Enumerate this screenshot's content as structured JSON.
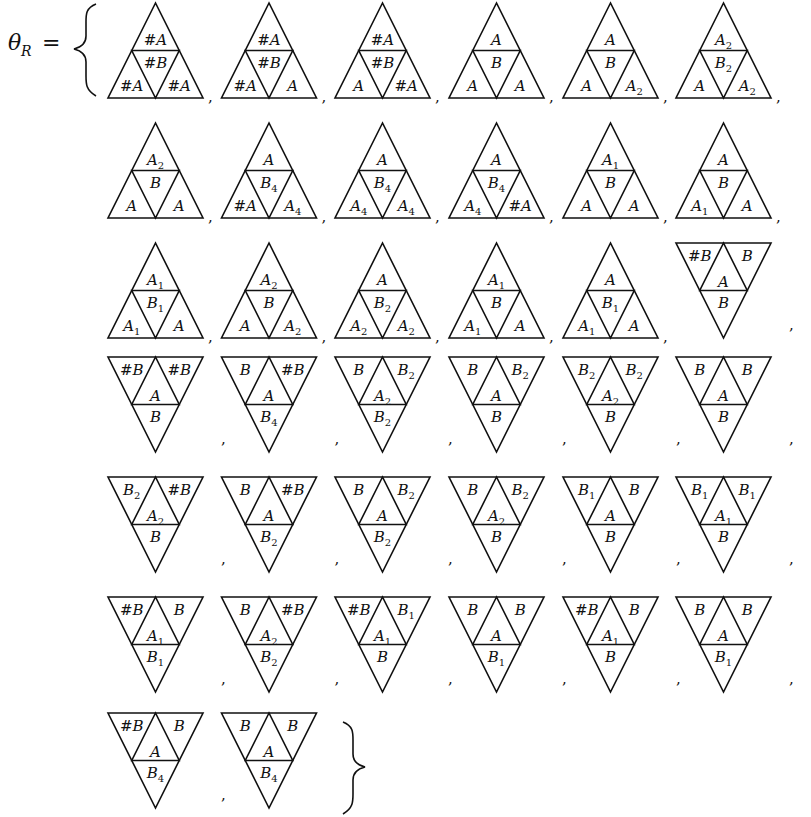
{
  "equation": {
    "lhs_symbol": "θ",
    "lhs_subscript": "R",
    "equals": "=",
    "separator": ",",
    "open_brace": "{",
    "close_brace": "}"
  },
  "legend_note": "Each element is a 4-cell triangle: up-triangles list [top, center, bottom-left, bottom-right]; down-triangles list [top-left, top-right, center, bottom].",
  "elements": [
    {
      "orientation": "up",
      "cells": [
        {
          "base": "#A"
        },
        {
          "base": "#B"
        },
        {
          "base": "#A"
        },
        {
          "base": "#A"
        }
      ]
    },
    {
      "orientation": "up",
      "cells": [
        {
          "base": "#A"
        },
        {
          "base": "#B"
        },
        {
          "base": "#A"
        },
        {
          "base": "A"
        }
      ]
    },
    {
      "orientation": "up",
      "cells": [
        {
          "base": "#A"
        },
        {
          "base": "#B"
        },
        {
          "base": "A"
        },
        {
          "base": "#A"
        }
      ]
    },
    {
      "orientation": "up",
      "cells": [
        {
          "base": "A"
        },
        {
          "base": "B"
        },
        {
          "base": "A"
        },
        {
          "base": "A"
        }
      ]
    },
    {
      "orientation": "up",
      "cells": [
        {
          "base": "A"
        },
        {
          "base": "B"
        },
        {
          "base": "A"
        },
        {
          "base": "A",
          "sub": "2"
        }
      ]
    },
    {
      "orientation": "up",
      "cells": [
        {
          "base": "A",
          "sub": "2"
        },
        {
          "base": "B",
          "sub": "2"
        },
        {
          "base": "A"
        },
        {
          "base": "A",
          "sub": "2"
        }
      ]
    },
    {
      "orientation": "up",
      "cells": [
        {
          "base": "A",
          "sub": "2"
        },
        {
          "base": "B"
        },
        {
          "base": "A"
        },
        {
          "base": "A"
        }
      ]
    },
    {
      "orientation": "up",
      "cells": [
        {
          "base": "A"
        },
        {
          "base": "B",
          "sub": "4"
        },
        {
          "base": "#A"
        },
        {
          "base": "A",
          "sub": "4"
        }
      ]
    },
    {
      "orientation": "up",
      "cells": [
        {
          "base": "A"
        },
        {
          "base": "B",
          "sub": "4"
        },
        {
          "base": "A",
          "sub": "4"
        },
        {
          "base": "A",
          "sub": "4"
        }
      ]
    },
    {
      "orientation": "up",
      "cells": [
        {
          "base": "A"
        },
        {
          "base": "B",
          "sub": "4"
        },
        {
          "base": "A",
          "sub": "4"
        },
        {
          "base": "#A"
        }
      ]
    },
    {
      "orientation": "up",
      "cells": [
        {
          "base": "A",
          "sub": "1"
        },
        {
          "base": "B"
        },
        {
          "base": "A"
        },
        {
          "base": "A"
        }
      ]
    },
    {
      "orientation": "up",
      "cells": [
        {
          "base": "A"
        },
        {
          "base": "B"
        },
        {
          "base": "A",
          "sub": "1"
        },
        {
          "base": "A"
        }
      ]
    },
    {
      "orientation": "up",
      "cells": [
        {
          "base": "A",
          "sub": "1"
        },
        {
          "base": "B",
          "sub": "1"
        },
        {
          "base": "A",
          "sub": "1"
        },
        {
          "base": "A"
        }
      ]
    },
    {
      "orientation": "up",
      "cells": [
        {
          "base": "A",
          "sub": "2"
        },
        {
          "base": "B"
        },
        {
          "base": "A"
        },
        {
          "base": "A",
          "sub": "2"
        }
      ]
    },
    {
      "orientation": "up",
      "cells": [
        {
          "base": "A"
        },
        {
          "base": "B",
          "sub": "2"
        },
        {
          "base": "A",
          "sub": "2"
        },
        {
          "base": "A",
          "sub": "2"
        }
      ]
    },
    {
      "orientation": "up",
      "cells": [
        {
          "base": "A",
          "sub": "1"
        },
        {
          "base": "B"
        },
        {
          "base": "A",
          "sub": "1"
        },
        {
          "base": "A"
        }
      ]
    },
    {
      "orientation": "up",
      "cells": [
        {
          "base": "A"
        },
        {
          "base": "B",
          "sub": "1"
        },
        {
          "base": "A",
          "sub": "1"
        },
        {
          "base": "A"
        }
      ]
    },
    {
      "orientation": "down",
      "cells": [
        {
          "base": "#B"
        },
        {
          "base": "B"
        },
        {
          "base": "A"
        },
        {
          "base": "B"
        }
      ]
    },
    {
      "orientation": "down",
      "cells": [
        {
          "base": "#B"
        },
        {
          "base": "#B"
        },
        {
          "base": "A"
        },
        {
          "base": "B"
        }
      ]
    },
    {
      "orientation": "down",
      "cells": [
        {
          "base": "B"
        },
        {
          "base": "#B"
        },
        {
          "base": "A"
        },
        {
          "base": "B",
          "sub": "4"
        }
      ]
    },
    {
      "orientation": "down",
      "cells": [
        {
          "base": "B"
        },
        {
          "base": "B",
          "sub": "2"
        },
        {
          "base": "A",
          "sub": "2"
        },
        {
          "base": "B",
          "sub": "2"
        }
      ]
    },
    {
      "orientation": "down",
      "cells": [
        {
          "base": "B"
        },
        {
          "base": "B",
          "sub": "2"
        },
        {
          "base": "A"
        },
        {
          "base": "B"
        }
      ]
    },
    {
      "orientation": "down",
      "cells": [
        {
          "base": "B",
          "sub": "2"
        },
        {
          "base": "B",
          "sub": "2"
        },
        {
          "base": "A",
          "sub": "2"
        },
        {
          "base": "B"
        }
      ]
    },
    {
      "orientation": "down",
      "cells": [
        {
          "base": "B"
        },
        {
          "base": "B"
        },
        {
          "base": "A"
        },
        {
          "base": "B"
        }
      ]
    },
    {
      "orientation": "down",
      "cells": [
        {
          "base": "B",
          "sub": "2"
        },
        {
          "base": "#B"
        },
        {
          "base": "A",
          "sub": "2"
        },
        {
          "base": "B"
        }
      ]
    },
    {
      "orientation": "down",
      "cells": [
        {
          "base": "B"
        },
        {
          "base": "#B"
        },
        {
          "base": "A"
        },
        {
          "base": "B",
          "sub": "2"
        }
      ]
    },
    {
      "orientation": "down",
      "cells": [
        {
          "base": "B"
        },
        {
          "base": "B",
          "sub": "2"
        },
        {
          "base": "A"
        },
        {
          "base": "B",
          "sub": "2"
        }
      ]
    },
    {
      "orientation": "down",
      "cells": [
        {
          "base": "B"
        },
        {
          "base": "B",
          "sub": "2"
        },
        {
          "base": "A",
          "sub": "2"
        },
        {
          "base": "B"
        }
      ]
    },
    {
      "orientation": "down",
      "cells": [
        {
          "base": "B",
          "sub": "1"
        },
        {
          "base": "B"
        },
        {
          "base": "A"
        },
        {
          "base": "B"
        }
      ]
    },
    {
      "orientation": "down",
      "cells": [
        {
          "base": "B",
          "sub": "1"
        },
        {
          "base": "B",
          "sub": "1"
        },
        {
          "base": "A",
          "sub": "1"
        },
        {
          "base": "B"
        }
      ]
    },
    {
      "orientation": "down",
      "cells": [
        {
          "base": "#B"
        },
        {
          "base": "B"
        },
        {
          "base": "A",
          "sub": "1"
        },
        {
          "base": "B",
          "sub": "1"
        }
      ]
    },
    {
      "orientation": "down",
      "cells": [
        {
          "base": "B"
        },
        {
          "base": "#B"
        },
        {
          "base": "A",
          "sub": "2"
        },
        {
          "base": "B",
          "sub": "2"
        }
      ]
    },
    {
      "orientation": "down",
      "cells": [
        {
          "base": "#B"
        },
        {
          "base": "B",
          "sub": "1"
        },
        {
          "base": "A",
          "sub": "1"
        },
        {
          "base": "B"
        }
      ]
    },
    {
      "orientation": "down",
      "cells": [
        {
          "base": "B"
        },
        {
          "base": "B"
        },
        {
          "base": "A"
        },
        {
          "base": "B",
          "sub": "1"
        }
      ]
    },
    {
      "orientation": "down",
      "cells": [
        {
          "base": "#B"
        },
        {
          "base": "B"
        },
        {
          "base": "A",
          "sub": "1"
        },
        {
          "base": "B"
        }
      ]
    },
    {
      "orientation": "down",
      "cells": [
        {
          "base": "B"
        },
        {
          "base": "B"
        },
        {
          "base": "A"
        },
        {
          "base": "B",
          "sub": "1"
        }
      ]
    },
    {
      "orientation": "down",
      "cells": [
        {
          "base": "#B"
        },
        {
          "base": "B"
        },
        {
          "base": "A"
        },
        {
          "base": "B",
          "sub": "4"
        }
      ]
    },
    {
      "orientation": "down",
      "cells": [
        {
          "base": "B"
        },
        {
          "base": "B"
        },
        {
          "base": "A"
        },
        {
          "base": "B",
          "sub": "4"
        }
      ]
    }
  ]
}
